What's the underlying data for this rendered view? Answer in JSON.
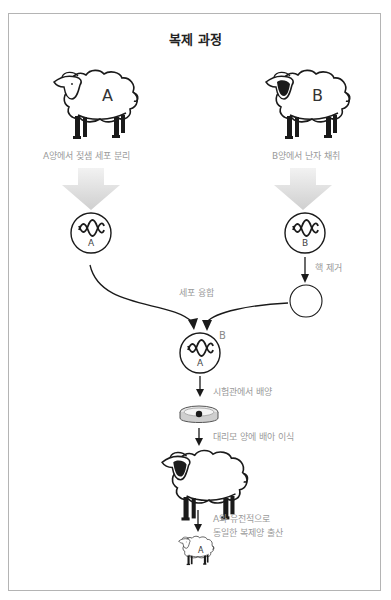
{
  "title": "복제 과정",
  "colors": {
    "border": "#b4b4b4",
    "ink": "#1a1a1a",
    "label": "#9a9a9a",
    "big_arrow": "#d4d4d4"
  },
  "sheep": {
    "donor_a": {
      "letter": "A",
      "face": "light"
    },
    "donor_b": {
      "letter": "B",
      "face": "dark"
    },
    "surrogate": {
      "letter": "",
      "face": "dark"
    },
    "clone": {
      "letter": "A",
      "face": "light"
    }
  },
  "cells": {
    "cell_a": {
      "letter": "A",
      "icon": "dna-icon"
    },
    "cell_b": {
      "letter": "B",
      "icon": "dna-icon"
    },
    "enucleated_egg": {
      "letter": ""
    },
    "fused_cell": {
      "inner_letter": "A",
      "outer_letter": "B",
      "icon": "dna-icon"
    }
  },
  "labels": {
    "step_a": "A양에서 젖샘 세포 분리",
    "step_b": "B양에서 난자 채취",
    "enucleation": "핵 제거",
    "fusion": "세포 융합",
    "culture": "시험관에서 배양",
    "implant": "대리모 양에 배아 이식",
    "birth_line1": "A와 유전적으로",
    "birth_line2": "동일한 복제양 출산"
  }
}
